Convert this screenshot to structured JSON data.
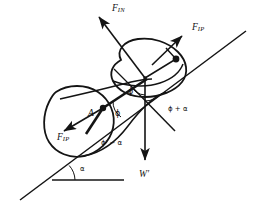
{
  "figure": {
    "background_color": "#ffffff",
    "line_color": "#141414",
    "labels": {
      "force_in": {
        "base": "F",
        "sub": "IN"
      },
      "force_ip_upper": {
        "base": "F",
        "sub": "IP"
      },
      "force_ip_lower": {
        "base": "F",
        "sub": "IP"
      },
      "weight": "W′",
      "point_a": "A",
      "angle_phi_upper": "ϕ",
      "angle_phi_lower": "ϕ",
      "angle_phi_plus_alpha": "ϕ + α",
      "angle_phi_prime_minus_alpha": "ϕ′ − α",
      "angle_alpha": "α"
    },
    "geometry": {
      "incline_line": {
        "x1": 20,
        "y1": 200,
        "x2": 246,
        "y2": 31
      },
      "baseline": {
        "x1": 52,
        "y1": 180,
        "x2": 124,
        "y2": 180
      },
      "incline_angle_vertex": {
        "x": 52,
        "y": 180
      },
      "central_vertex": {
        "x": 145,
        "y": 78
      },
      "point_a_node": {
        "x": 103,
        "y": 108
      },
      "upper_right_node": {
        "x": 176,
        "y": 60
      },
      "weight_arrow": {
        "x1": 145,
        "y1": 78,
        "x2": 145,
        "y2": 164
      },
      "force_in_arrow": {
        "x1": 145,
        "y1": 78,
        "x2": 96,
        "y2": 13
      },
      "force_ip_upper_arrow": {
        "x1": 155,
        "y1": 62,
        "x2": 184,
        "y2": 34
      },
      "force_ip_lower_arrow": {
        "x1": 103,
        "y1": 108,
        "x2": 61,
        "y2": 133
      },
      "oblique_line": {
        "x1": 128,
        "y1": 83,
        "x2": 175,
        "y2": 131
      }
    }
  }
}
